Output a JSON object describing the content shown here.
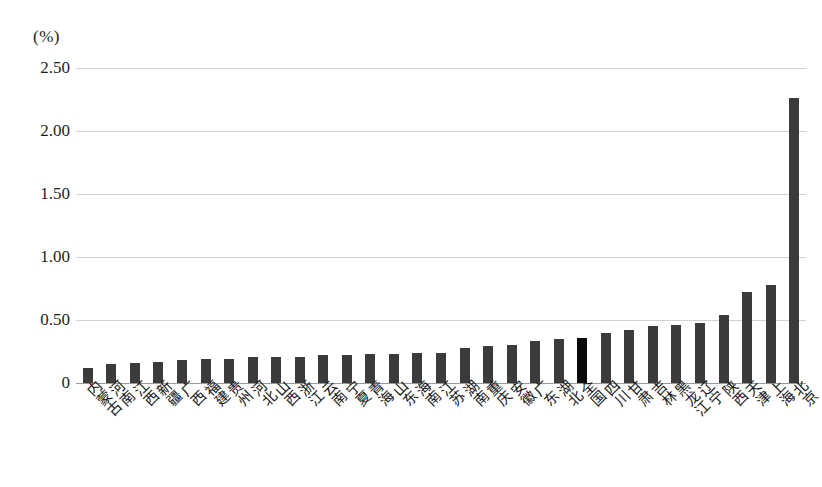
{
  "chart_data": {
    "type": "bar",
    "title": "",
    "subtitle": "",
    "xlabel": "",
    "ylabel": "(%)",
    "unit_caption": "(%)",
    "ylim": [
      0,
      2.5
    ],
    "yticks": [
      "0",
      "0.50",
      "1.00",
      "1.50",
      "2.00",
      "2.50"
    ],
    "ytick_values": [
      0,
      0.5,
      1.0,
      1.5,
      2.0,
      2.5
    ],
    "grid": true,
    "legend": "none",
    "bar_color": "#3b3b3b",
    "highlight_color": "#0a0a0a",
    "highlight_category": "全国",
    "categories": [
      "内蒙古",
      "河南",
      "江西",
      "新疆",
      "广西",
      "福建",
      "贵州",
      "河北",
      "山西",
      "浙江",
      "云南",
      "宁夏",
      "青海",
      "山东",
      "海南",
      "江苏",
      "湖南",
      "重庆",
      "安徽",
      "广东",
      "湖北",
      "全国",
      "四川",
      "甘肃",
      "吉林",
      "黑龙江",
      "辽宁",
      "陕西",
      "天津",
      "上海",
      "北京"
    ],
    "values": [
      0.12,
      0.15,
      0.16,
      0.17,
      0.18,
      0.19,
      0.19,
      0.21,
      0.21,
      0.21,
      0.22,
      0.22,
      0.23,
      0.23,
      0.24,
      0.24,
      0.28,
      0.29,
      0.3,
      0.33,
      0.35,
      0.36,
      0.4,
      0.42,
      0.45,
      0.46,
      0.48,
      0.54,
      0.72,
      0.78,
      2.26
    ]
  }
}
